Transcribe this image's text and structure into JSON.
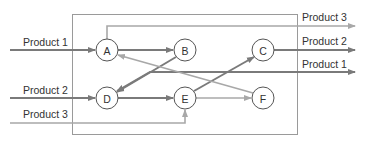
{
  "diagram": {
    "title": "",
    "colors": {
      "dark_line": "#7a7a7a",
      "light_line": "#a8a8a8",
      "box": "#9a9a9a",
      "node_fill": "#ffffff",
      "node_stroke": "#555555",
      "text": "#333333"
    },
    "nodes": [
      {
        "id": "A",
        "label": "A",
        "x": 107,
        "y": 50
      },
      {
        "id": "B",
        "label": "B",
        "x": 185,
        "y": 50
      },
      {
        "id": "C",
        "label": "C",
        "x": 263,
        "y": 50
      },
      {
        "id": "D",
        "label": "D",
        "x": 107,
        "y": 98
      },
      {
        "id": "E",
        "label": "E",
        "x": 185,
        "y": 98
      },
      {
        "id": "F",
        "label": "F",
        "x": 263,
        "y": 98
      }
    ],
    "inputs": [
      {
        "label": "Product 1",
        "target": "A"
      },
      {
        "label": "Product 2",
        "target": "D"
      },
      {
        "label": "Product 3",
        "target": "E"
      }
    ],
    "outputs": [
      {
        "label": "Product 3",
        "source": "A"
      },
      {
        "label": "Product 2",
        "source": "C"
      },
      {
        "label": "Product 1",
        "source": "D"
      }
    ],
    "edges": [
      {
        "from": "A",
        "to": "B",
        "style": "dark"
      },
      {
        "from": "B",
        "to": "D",
        "style": "dark"
      },
      {
        "from": "D",
        "to": "E",
        "style": "dark"
      },
      {
        "from": "E",
        "to": "C",
        "style": "dark"
      },
      {
        "from": "E",
        "to": "F",
        "style": "light"
      },
      {
        "from": "F",
        "to": "A",
        "style": "light"
      }
    ]
  }
}
